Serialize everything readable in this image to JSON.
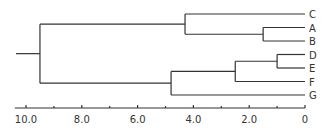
{
  "chart_data": {
    "type": "dendrogram",
    "title": "",
    "xlabel": "",
    "ylabel": "",
    "orientation": "leaves-right",
    "xlim": [
      10.0,
      0
    ],
    "leaves": [
      "C",
      "A",
      "B",
      "D",
      "E",
      "F",
      "G"
    ],
    "merges": [
      {
        "left": "D",
        "right": "E",
        "height": 1.0
      },
      {
        "left": "A",
        "right": "B",
        "height": 1.5
      },
      {
        "left": "D-E",
        "right": "F",
        "height": 2.5
      },
      {
        "left": "C",
        "right": "A-B",
        "height": 4.3
      },
      {
        "left": "D-E-F",
        "right": "G",
        "height": 4.8
      },
      {
        "left": "C-A-B",
        "right": "D-E-F-G",
        "height": 9.5
      }
    ],
    "axis": {
      "tick_labels": [
        "10.0",
        "8.0",
        "6.0",
        "4.0",
        "2.0",
        "0"
      ],
      "tick_values": [
        10,
        8,
        6,
        4,
        2,
        0
      ],
      "minor_ticks": [
        9,
        7,
        5,
        3,
        1
      ]
    }
  },
  "colors": {
    "line": "#333333",
    "background": "#ffffff"
  }
}
